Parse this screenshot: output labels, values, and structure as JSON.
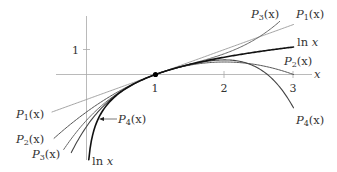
{
  "chart_data": {
    "type": "line",
    "title": "",
    "xlabel": "x",
    "ylabel": "",
    "xlim": [
      -0.5,
      3.2
    ],
    "ylim": [
      -3.4,
      2.9
    ],
    "grid": false,
    "x_ticks": [
      1,
      2,
      3
    ],
    "y_ticks": [
      1
    ],
    "center_point": {
      "x": 1,
      "y": 0
    },
    "series": [
      {
        "name": "ln x",
        "formula": "ln(x)",
        "x_range": [
          0.033,
          3.0
        ],
        "color": "#111111",
        "width": 1.6
      },
      {
        "name": "P1(x)",
        "formula": "(x-1)",
        "x_range": [
          -0.5,
          3.0
        ],
        "color": "#9a9a9a",
        "width": 0.9
      },
      {
        "name": "P2(x)",
        "formula": "(x-1) - (x-1)^2/2",
        "x_range": [
          -0.47,
          3.0
        ],
        "color": "#555555",
        "width": 1.0
      },
      {
        "name": "P3(x)",
        "formula": "(x-1) - (x-1)^2/2 + (x-1)^3/3",
        "x_range": [
          -0.33,
          2.8
        ],
        "color": "#666666",
        "width": 1.0
      },
      {
        "name": "P4(x)",
        "formula": "(x-1) - (x-1)^2/2 + (x-1)^3/3 - (x-1)^4/4",
        "x_range": [
          -0.22,
          3.0
        ],
        "color": "#444444",
        "width": 1.1
      }
    ],
    "annotations": [
      {
        "text": "P3(x)",
        "position": "upper right"
      },
      {
        "text": "P1(x)",
        "position": "upper right"
      },
      {
        "text": "ln x",
        "position": "right"
      },
      {
        "text": "P2(x)",
        "position": "right"
      },
      {
        "text": "P4(x)",
        "position": "lower right"
      },
      {
        "text": "P1(x)",
        "position": "left"
      },
      {
        "text": "P2(x)",
        "position": "left"
      },
      {
        "text": "P3(x)",
        "position": "lower left"
      },
      {
        "text": "ln x",
        "position": "bottom"
      },
      {
        "text": "P4(x)",
        "position": "lower left, with arrow"
      }
    ]
  },
  "axes": {
    "x_label": "x",
    "x_tick_1": "1",
    "x_tick_2": "2",
    "x_tick_3": "3",
    "y_tick_1": "1"
  },
  "labels": {
    "p3_right": "P",
    "p3_right_sub": "3",
    "p3_right_arg": "(x)",
    "p1_right": "P",
    "p1_right_sub": "1",
    "p1_right_arg": "(x)",
    "ln_right": "ln",
    "ln_right_var": "x",
    "p2_right": "P",
    "p2_right_sub": "2",
    "p2_right_arg": "(x)",
    "p4_right": "P",
    "p4_right_sub": "4",
    "p4_right_arg": "(x)",
    "p1_left": "P",
    "p1_left_sub": "1",
    "p1_left_arg": "(x)",
    "p2_left": "P",
    "p2_left_sub": "2",
    "p2_left_arg": "(x)",
    "p3_left": "P",
    "p3_left_sub": "3",
    "p3_left_arg": "(x)",
    "ln_bottom": "ln",
    "ln_bottom_var": "x",
    "p4_arrow": "P",
    "p4_arrow_sub": "4",
    "p4_arrow_arg": "(x)"
  },
  "colors": {
    "axis": "#9a9a9a",
    "text": "#333333",
    "point": "#000000"
  }
}
